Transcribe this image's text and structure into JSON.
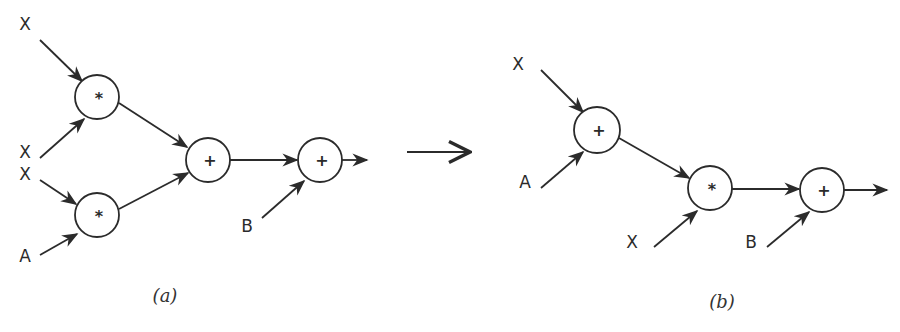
{
  "figure": {
    "transform_arrow": {
      "x1": 407,
      "y1": 152,
      "x2": 470,
      "y2": 152
    },
    "diagrams": [
      {
        "id": "a",
        "caption": "(a)",
        "caption_pos": {
          "x": 165,
          "y": 302
        },
        "nodes": [
          {
            "id": "a_m1",
            "op": "*",
            "x": 97,
            "y": 97,
            "r": 22
          },
          {
            "id": "a_m2",
            "op": "*",
            "x": 97,
            "y": 215,
            "r": 22
          },
          {
            "id": "a_p1",
            "op": "+",
            "x": 208,
            "y": 160,
            "r": 22
          },
          {
            "id": "a_p2",
            "op": "+",
            "x": 320,
            "y": 160,
            "r": 22
          }
        ],
        "inputs": [
          {
            "label": "X",
            "lx": 25,
            "ly": 30,
            "from": {
              "x": 40,
              "y": 40
            },
            "to": "a_m1",
            "tx": 82,
            "ty": 81
          },
          {
            "label": "X",
            "lx": 25,
            "ly": 158,
            "from": {
              "x": 40,
              "y": 158
            },
            "to": "a_m1",
            "tx": 84,
            "ty": 119
          },
          {
            "label": "X",
            "lx": 25,
            "ly": 180,
            "from": {
              "x": 40,
              "y": 180
            },
            "to": "a_m2",
            "tx": 76,
            "ty": 204
          },
          {
            "label": "A",
            "lx": 25,
            "ly": 262,
            "from": {
              "x": 40,
              "y": 255
            },
            "to": "a_m2",
            "tx": 77,
            "ty": 234
          },
          {
            "label": "B",
            "lx": 247,
            "ly": 232,
            "from": {
              "x": 262,
              "y": 218
            },
            "to": "a_p2",
            "tx": 304,
            "ty": 181
          }
        ],
        "edges": [
          {
            "from": "a_m1",
            "to": "a_p1",
            "x1": 119,
            "y1": 103,
            "x2": 187,
            "y2": 147
          },
          {
            "from": "a_m2",
            "to": "a_p1",
            "x1": 119,
            "y1": 209,
            "x2": 188,
            "y2": 173
          },
          {
            "from": "a_p1",
            "to": "a_p2",
            "x1": 230,
            "y1": 160,
            "x2": 297,
            "y2": 160
          }
        ],
        "output": {
          "from": "a_p2",
          "x1": 342,
          "y1": 160,
          "x2": 367,
          "y2": 160
        }
      },
      {
        "id": "b",
        "caption": "(b)",
        "caption_pos": {
          "x": 722,
          "y": 308
        },
        "nodes": [
          {
            "id": "b_p1",
            "op": "+",
            "x": 597,
            "y": 130,
            "r": 23
          },
          {
            "id": "b_m1",
            "op": "*",
            "x": 710,
            "y": 188,
            "r": 22
          },
          {
            "id": "b_p2",
            "op": "+",
            "x": 822,
            "y": 190,
            "r": 22
          }
        ],
        "inputs": [
          {
            "label": "X",
            "lx": 518,
            "ly": 70,
            "from": {
              "x": 541,
              "y": 70
            },
            "to": "b_p1",
            "tx": 583,
            "ty": 112
          },
          {
            "label": "A",
            "lx": 525,
            "ly": 188,
            "from": {
              "x": 541,
              "y": 188
            },
            "to": "b_p1",
            "tx": 583,
            "ty": 152
          },
          {
            "label": "X",
            "lx": 632,
            "ly": 248,
            "from": {
              "x": 654,
              "y": 247
            },
            "to": "b_m1",
            "tx": 697,
            "ty": 211
          },
          {
            "label": "B",
            "lx": 751,
            "ly": 248,
            "from": {
              "x": 767,
              "y": 247
            },
            "to": "b_p2",
            "tx": 809,
            "ty": 212
          }
        ],
        "edges": [
          {
            "from": "b_p1",
            "to": "b_m1",
            "x1": 619,
            "y1": 138,
            "x2": 689,
            "y2": 178
          },
          {
            "from": "b_m1",
            "to": "b_p2",
            "x1": 732,
            "y1": 189,
            "x2": 799,
            "y2": 189
          }
        ],
        "output": {
          "from": "b_p2",
          "x1": 844,
          "y1": 190,
          "x2": 887,
          "y2": 190
        }
      }
    ],
    "colors": {
      "ink": "#2b2b2b",
      "background": "#ffffff"
    }
  }
}
